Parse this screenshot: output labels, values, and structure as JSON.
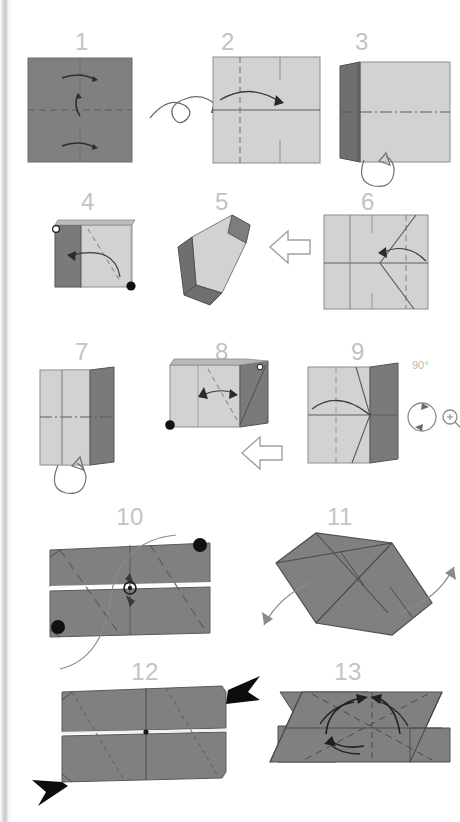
{
  "page": {
    "width": 460,
    "height": 822,
    "background": "#ffffff",
    "gutter_color": "#cccccc",
    "type": "origami-folding-instructions"
  },
  "palette": {
    "paper_dark": "#808080",
    "paper_dark_shade": "#6f6f6f",
    "paper_light": "#d2d2d2",
    "paper_light_shade": "#c2c2c2",
    "crease_line": "#5a5a5a",
    "edge_line": "#4a4a4a",
    "arrow_line": "#555555",
    "number_gray": "#c3c3c3",
    "marker_black": "#111111",
    "white": "#ffffff"
  },
  "steps": [
    {
      "number": "1",
      "num_x": 82,
      "num_y": 30,
      "symbols": [
        "valley-fold-arrow",
        "center-dashed-line",
        "pleat-arrow"
      ],
      "paper": "dark",
      "note": "dark square, horizontal dashed mid crease, three small fold arrows"
    },
    {
      "number": "2",
      "num_x": 228,
      "num_y": 30,
      "symbols": [
        "turn-over-arrow",
        "vertical-dashed-line",
        "curved-fold-arrow"
      ],
      "paper": "light",
      "note": "light square with vertical dashed quarter line and curved fold arrow"
    },
    {
      "number": "3",
      "num_x": 362,
      "num_y": 30,
      "symbols": [
        "dash-dot-center-line",
        "unfold-loop-arrow"
      ],
      "paper": "light-with-dark-flap",
      "note": "left dark flap folded over light square, unfold loop arrow below"
    },
    {
      "number": "4",
      "num_x": 88,
      "num_y": 190,
      "symbols": [
        "open-circle-marker",
        "filled-circle-marker",
        "curved-fold-arrow",
        "diagonal-dashed-line"
      ],
      "paper": "light-with-dark-flap",
      "note": "reference points: hollow dot top-left, solid dot bottom-right"
    },
    {
      "number": "5",
      "num_x": 222,
      "num_y": 190,
      "symbols": [
        "rotated-shape",
        "open-outline-arrow"
      ],
      "paper": "light-with-dark-flap",
      "note": "3D rotated view; hollow block arrow points right to step 6"
    },
    {
      "number": "6",
      "num_x": 368,
      "num_y": 190,
      "symbols": [
        "crease-pattern",
        "vertical-dashed-line",
        "curved-fold-arrow"
      ],
      "paper": "light",
      "note": "light square with V-shaped crease lines and curved arrow"
    },
    {
      "number": "7",
      "num_x": 82,
      "num_y": 340,
      "symbols": [
        "dash-dot-center-line",
        "unfold-loop-arrow"
      ],
      "paper": "light-with-dark-flap",
      "note": "tall light rectangle with dark right band"
    },
    {
      "number": "8",
      "num_x": 222,
      "num_y": 340,
      "symbols": [
        "filled-circle-marker",
        "squash-fold-arrow",
        "diagonal-dashed-line",
        "open-outline-arrow"
      ],
      "paper": "light-with-dark-flap",
      "note": "solid dot bottom-left; hollow block arrow points to step 9"
    },
    {
      "number": "9",
      "num_x": 358,
      "num_y": 340,
      "symbols": [
        "crease-pattern",
        "vertical-dashed-line",
        "curved-fold-arrow",
        "rotate-symbol",
        "magnify-icon"
      ],
      "paper": "light-with-dark-flap",
      "rotate_label": "90°",
      "note": "rotate 90 degrees and enlarge"
    },
    {
      "number": "10",
      "num_x": 130,
      "num_y": 505,
      "symbols": [
        "filled-circle-marker",
        "pivot-circle",
        "rotation-arrows",
        "diagonal-dashed-line"
      ],
      "paper": "dark",
      "note": "wide dark rectangle split by horizontal gap, two solid dots, pivot ring at centre"
    },
    {
      "number": "11",
      "num_x": 340,
      "num_y": 505,
      "symbols": [
        "pull-arrow-left",
        "pull-arrow-right",
        "crease-pattern"
      ],
      "paper": "dark",
      "note": "rotated parallelogram, two thin arrows pulling outward"
    },
    {
      "number": "12",
      "num_x": 145,
      "num_y": 660,
      "symbols": [
        "solid-black-arrowhead-top-right",
        "solid-black-arrowhead-bottom-left",
        "diagonal-dashed-line"
      ],
      "paper": "dark",
      "note": "wide dark rectangle with two large solid push arrowheads"
    },
    {
      "number": "13",
      "num_x": 348,
      "num_y": 660,
      "symbols": [
        "curved-fold-arrow-up-left",
        "curved-fold-arrow-up-right",
        "curved-fold-arrow-down",
        "center-dashed-lines"
      ],
      "paper": "dark",
      "note": "parallelogram with three curved folding arrows converging to center"
    }
  ],
  "annotations": {
    "rotate_90_label": "90°",
    "magnify_label": "enlarge"
  }
}
